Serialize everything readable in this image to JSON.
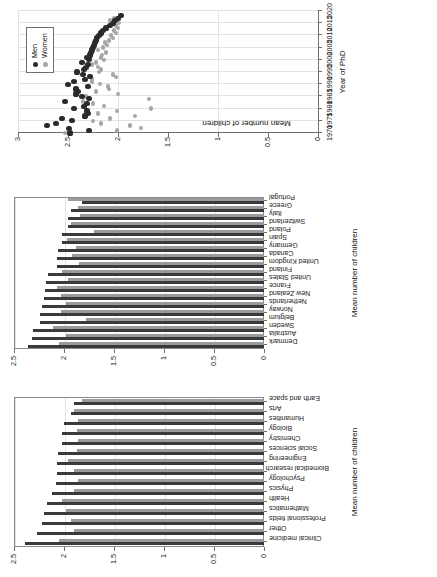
{
  "figure": {
    "orientation": "rotated-90-ccw",
    "colors": {
      "men": "#2b2b2b",
      "women": "#a6a6a6",
      "grid": "#e2e2e2",
      "axis": "#6f6f6f"
    }
  },
  "legend": {
    "men_label": "Men",
    "women_label": "Women"
  },
  "chart_data": [
    {
      "id": "fields",
      "type": "bar",
      "title": "",
      "xlabel": "",
      "ylabel": "Mean number of children",
      "ylim": [
        0,
        2.5
      ],
      "yticks": [
        0,
        0.5,
        1,
        1.5,
        2,
        2.5
      ],
      "ytick_labels": [
        "0",
        "0.5",
        "1",
        "1.5",
        "2",
        "2.5"
      ],
      "grid": true,
      "legend_position": "none",
      "categories": [
        "Clinical medicine",
        "Other",
        "Professional fields",
        "Mathematics",
        "Health",
        "Physics",
        "Psychology",
        "Biomedical research",
        "Engineering",
        "Social sciences",
        "Chemistry",
        "Biology",
        "Humanities",
        "Arts",
        "Earth and space"
      ],
      "series": [
        {
          "name": "Men",
          "values": [
            2.39,
            2.27,
            2.22,
            2.2,
            2.17,
            2.12,
            2.08,
            2.07,
            2.07,
            2.06,
            2.02,
            2.02,
            2.0,
            1.93,
            1.9
          ]
        },
        {
          "name": "Women",
          "values": [
            2.05,
            1.9,
            1.93,
            1.98,
            2.02,
            1.9,
            1.86,
            1.9,
            1.96,
            1.87,
            1.86,
            1.87,
            1.86,
            1.9,
            1.82
          ]
        }
      ]
    },
    {
      "id": "countries",
      "type": "bar",
      "title": "",
      "xlabel": "",
      "ylabel": "Mean number of children",
      "ylim": [
        0,
        2.5
      ],
      "yticks": [
        0,
        0.5,
        1,
        1.5,
        2,
        2.5
      ],
      "ytick_labels": [
        "0",
        "0.5",
        "1",
        "1.5",
        "2",
        "2.5"
      ],
      "grid": true,
      "legend_position": "none",
      "categories": [
        "Denmark",
        "Australia",
        "Sweden",
        "Belgium",
        "Norway",
        "Netherlands",
        "New Zealand",
        "France",
        "United States",
        "Finland",
        "United Kingdom",
        "Canada",
        "Germany",
        "Spain",
        "Poland",
        "Switzerland",
        "Italy",
        "Greece",
        "Portugal"
      ],
      "series": [
        {
          "name": "Men",
          "values": [
            2.36,
            2.32,
            2.31,
            2.24,
            2.24,
            2.22,
            2.2,
            2.19,
            2.18,
            2.16,
            2.07,
            2.07,
            2.06,
            2.02,
            2.02,
            1.96,
            1.96,
            1.93,
            1.82
          ]
        },
        {
          "name": "Women",
          "values": [
            2.05,
            1.98,
            2.11,
            1.78,
            2.03,
            1.98,
            2.03,
            2.07,
            1.96,
            2.02,
            1.85,
            1.92,
            1.88,
            1.97,
            1.7,
            1.93,
            1.84,
            1.86,
            1.96
          ]
        }
      ]
    },
    {
      "id": "trend",
      "type": "scatter",
      "title": "",
      "xlabel": "Year of PhD",
      "ylabel": "Mean number of children",
      "xlim": [
        1970,
        2020
      ],
      "ylim": [
        0,
        3
      ],
      "xticks": [
        1970,
        1975,
        1980,
        1985,
        1990,
        1995,
        2000,
        2005,
        2010,
        2015,
        2020
      ],
      "xtick_labels": [
        "1970",
        "1975",
        "1980",
        "1985",
        "1990",
        "1995",
        "2000",
        "2005",
        "2010",
        "2015",
        "2020"
      ],
      "yticks": [
        0,
        0.5,
        1,
        1.5,
        2,
        2.5,
        3
      ],
      "ytick_labels": [
        "0",
        "0.5",
        "1",
        "1.5",
        "2",
        "2.5",
        "3"
      ],
      "grid": true,
      "legend_position": "top-left",
      "x": [
        1970,
        1971,
        1972,
        1973,
        1974,
        1975,
        1976,
        1977,
        1978,
        1979,
        1980,
        1981,
        1982,
        1983,
        1984,
        1985,
        1986,
        1987,
        1988,
        1989,
        1990,
        1991,
        1992,
        1993,
        1994,
        1995,
        1996,
        1997,
        1998,
        1999,
        2000,
        2001,
        2002,
        2003,
        2004,
        2005,
        2006,
        2007,
        2008,
        2009,
        2010,
        2011,
        2012,
        2013,
        2014,
        2015,
        2016,
        2017,
        2018
      ],
      "series": [
        {
          "name": "Men",
          "values": [
            2.48,
            2.29,
            2.49,
            2.71,
            2.62,
            2.46,
            2.56,
            2.33,
            2.3,
            2.31,
            2.44,
            2.34,
            2.31,
            2.53,
            2.29,
            2.36,
            2.42,
            2.4,
            2.42,
            2.3,
            2.5,
            2.44,
            2.33,
            2.28,
            2.35,
            2.41,
            2.34,
            2.32,
            2.3,
            2.36,
            2.29,
            2.31,
            2.28,
            2.27,
            2.26,
            2.25,
            2.24,
            2.23,
            2.22,
            2.21,
            2.19,
            2.17,
            2.15,
            2.12,
            2.08,
            2.05,
            2.03,
            2.0,
            1.97
          ]
        },
        {
          "name": "Women",
          "values": [
            2.53,
            2.01,
            1.77,
            1.88,
            2.17,
            2.25,
            2.08,
            1.83,
            2.2,
            2.01,
            1.67,
            2.14,
            2.25,
            2.35,
            1.69,
            2.32,
            2.0,
            2.22,
            2.09,
            2.1,
            2.18,
            2.26,
            2.26,
            2.02,
            2.05,
            2.19,
            2.17,
            2.2,
            2.26,
            2.22,
            2.14,
            2.17,
            2.16,
            2.12,
            2.2,
            2.15,
            2.11,
            2.13,
            2.09,
            2.05,
            2.07,
            2.02,
            2.04,
            2.0,
            2.02,
            1.99,
            2.08,
            2.04,
            1.97
          ]
        }
      ]
    }
  ]
}
